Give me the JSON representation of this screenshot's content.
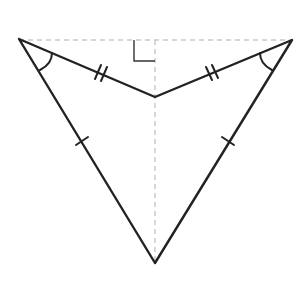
{
  "diagram": {
    "type": "geometry",
    "shape": "concave quadrilateral (dart / arrowhead)",
    "colors": {
      "background": "#ffffff",
      "line": "#222222",
      "dashed": "#c8c8c8"
    },
    "vertices": {
      "left": [
        19,
        39
      ],
      "right": [
        292,
        40
      ],
      "inner": [
        155,
        97
      ],
      "bottom": [
        155,
        263
      ]
    },
    "segments": [
      {
        "from": "left",
        "to": "inner",
        "tick_marks": 2
      },
      {
        "from": "right",
        "to": "inner",
        "tick_marks": 2
      },
      {
        "from": "left",
        "to": "bottom",
        "tick_marks": 1
      },
      {
        "from": "right",
        "to": "bottom",
        "tick_marks": 1
      }
    ],
    "auxiliary_lines": [
      {
        "style": "dashed",
        "from": [
          19,
          40
        ],
        "to": [
          292,
          40
        ]
      },
      {
        "style": "dashed",
        "from": [
          155,
          40
        ],
        "to": [
          155,
          263
        ]
      }
    ],
    "angle_marks": [
      {
        "at": "left",
        "type": "arc",
        "count": 1
      },
      {
        "at": "right",
        "type": "arc",
        "count": 1
      },
      {
        "at": [
          155,
          40
        ],
        "type": "right-angle"
      }
    ]
  }
}
